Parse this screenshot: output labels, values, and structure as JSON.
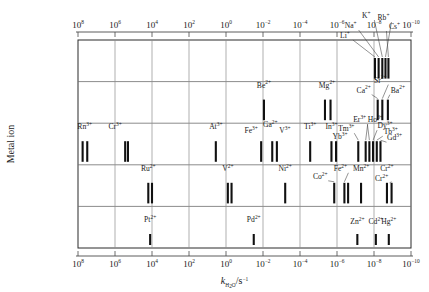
{
  "axes": {
    "x_title_main": "k",
    "x_title_sub": "H",
    "x_title_sub2": "2",
    "x_title_sub3": "O",
    "x_title_tail": "/s",
    "x_title_sup": "−1",
    "x_title_plain": "kH2O/s-1",
    "y_title": "Metal ion",
    "x_tick_mantissa": "10",
    "x_ticks": [
      {
        "exp": "8",
        "value": 100000000.0
      },
      {
        "exp": "6",
        "value": 1000000.0
      },
      {
        "exp": "4",
        "value": 10000.0
      },
      {
        "exp": "2",
        "value": 100.0
      },
      {
        "exp": "0",
        "value": 1
      },
      {
        "exp": "−2",
        "value": 0.01
      },
      {
        "exp": "−4",
        "value": 0.0001
      },
      {
        "exp": "−6",
        "value": 1e-06
      },
      {
        "exp": "−8",
        "value": 1e-08
      },
      {
        "exp": "−10",
        "value": 1e-10
      }
    ]
  },
  "chart_data": {
    "type": "scatter",
    "title": "",
    "xlabel": "kH2O / s^-1",
    "ylabel": "Metal ion",
    "xlim": [
      8,
      -10
    ],
    "xscale": "log10",
    "x_axis_note": "log10 of kH2O, decreasing left to right from 1e8 to 1e-10",
    "grid": true,
    "legend_position": "none",
    "rows": [
      {
        "row": 1,
        "group": "monovalent-alkali",
        "points": [
          {
            "ion": "Li",
            "charge": "+",
            "log_k": -8.05,
            "label_dx": -30,
            "label_dy": -20,
            "leader": true
          },
          {
            "ion": "Na",
            "charge": "+",
            "log_k": -8.25,
            "label_dx": -28,
            "label_dy": -30,
            "leader": true
          },
          {
            "ion": "K",
            "charge": "+",
            "log_k": -8.45,
            "label_dx": -16,
            "label_dy": -40,
            "leader": true
          },
          {
            "ion": "Rb",
            "charge": "+",
            "log_k": -8.62,
            "label_dx": -2,
            "label_dy": -38,
            "leader": true
          },
          {
            "ion": "Cs",
            "charge": "+",
            "log_k": -8.78,
            "label_dx": 6,
            "label_dy": -29,
            "leader": true
          }
        ]
      },
      {
        "row": 2,
        "group": "divalent-main-group-and-alkaline-earth",
        "points": [
          {
            "ion": "Be",
            "charge": "2+",
            "log_k": -2.05,
            "label_dx": 0,
            "label_dy": -12,
            "leader": false
          },
          {
            "ion": "Mg",
            "charge": "2+",
            "log_k": -5.35,
            "label_dx": 2,
            "label_dy": -12,
            "leader": false
          },
          {
            "ion": "Mg",
            "charge": "2+",
            "log_k": -5.65,
            "label_dx": null,
            "label_dy": null,
            "leader": false
          },
          {
            "ion": "Ca",
            "charge": "2+",
            "log_k": -8.2,
            "label_dx": -14,
            "label_dy": -7,
            "leader": true
          },
          {
            "ion": "Sr",
            "charge": "2+",
            "log_k": -8.45,
            "label_dx": -2,
            "label_dy": -17,
            "leader": true
          },
          {
            "ion": "Ba",
            "charge": "2+",
            "log_k": -8.75,
            "label_dx": 10,
            "label_dy": -7,
            "leader": true
          }
        ]
      },
      {
        "row": 3,
        "group": "trivalent-ions-and-lanthanides",
        "points": [
          {
            "ion": "Rn",
            "charge": "3+",
            "log_k": 7.75,
            "label_dx": 2,
            "label_dy": -12,
            "leader": false
          },
          {
            "ion": "Rn",
            "charge": "3+",
            "log_k": 7.5,
            "label_dx": null,
            "label_dy": null,
            "leader": false
          },
          {
            "ion": "Cr",
            "charge": "3+",
            "log_k": 5.45,
            "label_dx": -10,
            "label_dy": -12,
            "leader": false
          },
          {
            "ion": "Cr",
            "charge": "3+",
            "log_k": 5.3,
            "label_dx": null,
            "label_dy": null,
            "leader": false
          },
          {
            "ion": "At",
            "charge": "3+",
            "log_k": 0.55,
            "label_dx": 0,
            "label_dy": -12,
            "leader": false
          },
          {
            "ion": "Fe",
            "charge": "3+",
            "log_k": -1.9,
            "label_dx": -10,
            "label_dy": -8,
            "leader": false
          },
          {
            "ion": "Ga",
            "charge": "2+",
            "log_k": -2.5,
            "label_dx": -2,
            "label_dy": -14,
            "leader": false
          },
          {
            "ion": "V",
            "charge": "3+",
            "log_k": -2.75,
            "label_dx": 8,
            "label_dy": -8,
            "leader": false
          },
          {
            "ion": "Ti",
            "charge": "3+",
            "log_k": -4.55,
            "label_dx": 0,
            "label_dy": -12,
            "leader": false
          },
          {
            "ion": "In",
            "charge": "3+",
            "log_k": -5.7,
            "label_dx": 0,
            "label_dy": -12,
            "leader": false
          },
          {
            "ion": "Yb",
            "charge": "3+",
            "log_k": -5.95,
            "label_dx": 4,
            "label_dy": -2,
            "leader": false
          },
          {
            "ion": "Tm",
            "charge": "3+",
            "log_k": -7.15,
            "label_dx": -12,
            "label_dy": -10,
            "leader": true
          },
          {
            "ion": "Er",
            "charge": "3+",
            "log_k": -7.55,
            "label_dx": -6,
            "label_dy": -19,
            "leader": true
          },
          {
            "ion": "Ho",
            "charge": "3+",
            "log_k": -7.75,
            "label_dx": 6,
            "label_dy": -19,
            "leader": true
          },
          {
            "ion": "Dy",
            "charge": "3+",
            "log_k": -7.95,
            "label_dx": 12,
            "label_dy": -13,
            "leader": true
          },
          {
            "ion": "Tb",
            "charge": "3+",
            "log_k": -8.15,
            "label_dx": 14,
            "label_dy": -7,
            "leader": true
          },
          {
            "ion": "Gd",
            "charge": "3+",
            "log_k": -8.35,
            "label_dx": 14,
            "label_dy": -1,
            "leader": true
          }
        ]
      },
      {
        "row": 4,
        "group": "divalent-transition-metals",
        "points": [
          {
            "ion": "Ru",
            "charge": "2+",
            "log_k": 4.2,
            "label_dx": 0,
            "label_dy": -12,
            "leader": false
          },
          {
            "ion": "Ru",
            "charge": "2+",
            "log_k": 4.0,
            "label_dx": null,
            "label_dy": null,
            "leader": false
          },
          {
            "ion": "V",
            "charge": "2+",
            "log_k": -0.1,
            "label_dx": 0,
            "label_dy": -12,
            "leader": false
          },
          {
            "ion": "V",
            "charge": "2+",
            "log_k": -0.3,
            "label_dx": null,
            "label_dy": null,
            "leader": false
          },
          {
            "ion": "Ni",
            "charge": "2+",
            "log_k": -3.2,
            "label_dx": 0,
            "label_dy": -12,
            "leader": false
          },
          {
            "ion": "Co",
            "charge": "2+",
            "log_k": -5.85,
            "label_dx": -14,
            "label_dy": -4,
            "leader": true
          },
          {
            "ion": "Fe",
            "charge": "2+",
            "log_k": -6.4,
            "label_dx": -4,
            "label_dy": -12,
            "leader": true
          },
          {
            "ion": "Fe",
            "charge": "2+",
            "log_k": -6.6,
            "label_dx": null,
            "label_dy": null,
            "leader": false
          },
          {
            "ion": "Mn",
            "charge": "2+",
            "log_k": -7.3,
            "label_dx": 0,
            "label_dy": -12,
            "leader": false
          },
          {
            "ion": "Cr",
            "charge": "2+",
            "log_k": -8.7,
            "label_dx": 0,
            "label_dy": -12,
            "leader": false
          },
          {
            "ion": "Cr",
            "charge": "2+",
            "log_k": -8.95,
            "label_dx": -10,
            "label_dy": -2,
            "leader": true
          }
        ]
      },
      {
        "row": 5,
        "group": "square-planar-and-d10-ions",
        "points": [
          {
            "ion": "Pt",
            "charge": "2+",
            "log_k": 4.1,
            "label_dx": 0,
            "label_dy": -12,
            "leader": false
          },
          {
            "ion": "Pd",
            "charge": "2+",
            "log_k": -1.5,
            "label_dx": 0,
            "label_dy": -12,
            "leader": false
          },
          {
            "ion": "Zn",
            "charge": "2+",
            "log_k": -7.1,
            "label_dx": 0,
            "label_dy": -10,
            "leader": false
          },
          {
            "ion": "Cd",
            "charge": "2+",
            "log_k": -8.1,
            "label_dx": 0,
            "label_dy": -10,
            "leader": false
          },
          {
            "ion": "Hg",
            "charge": "2+",
            "log_k": -8.8,
            "label_dx": 0,
            "label_dy": -10,
            "leader": false
          }
        ]
      }
    ]
  }
}
